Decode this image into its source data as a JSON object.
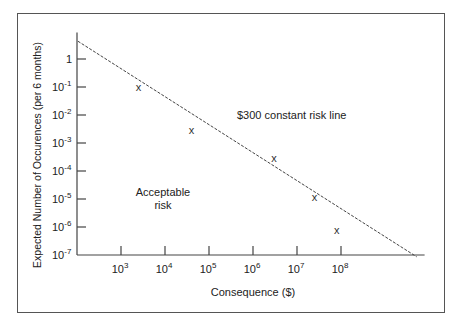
{
  "chart_data": {
    "type": "scatter",
    "title": "",
    "xlabel": "Consequence ($)",
    "ylabel": "Expected Number of Occurences (per 6 months)",
    "x_scale": "log",
    "y_scale": "log",
    "xlim_log10": [
      2,
      9.9
    ],
    "ylim_log10": [
      -7,
      0.95
    ],
    "x_ticks": [
      {
        "log": 3,
        "base": "10",
        "exp": "3"
      },
      {
        "log": 4,
        "base": "10",
        "exp": "4"
      },
      {
        "log": 5,
        "base": "10",
        "exp": "5"
      },
      {
        "log": 6,
        "base": "10",
        "exp": "6"
      },
      {
        "log": 7,
        "base": "10",
        "exp": "7"
      },
      {
        "log": 8,
        "base": "10",
        "exp": "8"
      }
    ],
    "y_ticks": [
      {
        "log": 0,
        "base": "1",
        "exp": ""
      },
      {
        "log": -1,
        "base": "10",
        "exp": "-1"
      },
      {
        "log": -2,
        "base": "10",
        "exp": "-2"
      },
      {
        "log": -3,
        "base": "10",
        "exp": "-3"
      },
      {
        "log": -4,
        "base": "10",
        "exp": "-4"
      },
      {
        "log": -5,
        "base": "10",
        "exp": "-5"
      },
      {
        "log": -6,
        "base": "10",
        "exp": "-6"
      },
      {
        "log": -7,
        "base": "10",
        "exp": "-7"
      }
    ],
    "grid": false,
    "legend": "none",
    "marker_symbol": "x",
    "points": [
      {
        "x": 2500,
        "y": 0.1
      },
      {
        "x": 40000,
        "y": 0.003
      },
      {
        "x": 3000000,
        "y": 0.0003
      },
      {
        "x": 25000000,
        "y": 1.2e-05
      },
      {
        "x": 80000000,
        "y": 8e-07
      }
    ],
    "reference_line": {
      "name": "$300 constant risk line",
      "product_constant": 300,
      "style": "dashed",
      "x_log_range": [
        2.02,
        9.72
      ]
    },
    "annotations": [
      {
        "text": "$300 constant risk line"
      },
      {
        "text_lines": [
          "Acceptable",
          "risk"
        ]
      }
    ]
  }
}
